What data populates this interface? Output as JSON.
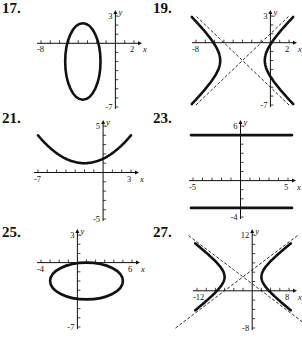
{
  "chart_data": [
    {
      "id": "17",
      "label": "17.",
      "type": "line",
      "shape": "ellipse",
      "center": [
        -3.5,
        -2
      ],
      "rx": 1.9,
      "ry": 4.2,
      "xlim": [
        -8,
        2
      ],
      "ylim": [
        -7,
        3
      ],
      "x_tick_labels": [
        "-8",
        "2"
      ],
      "y_tick_labels": [
        "3",
        "-7"
      ],
      "xlabel": "x",
      "ylabel": "y",
      "asymptotes": []
    },
    {
      "id": "19",
      "label": "19.",
      "type": "line",
      "shape": "hyperbola-horizontal",
      "center": [
        -3,
        -2
      ],
      "a": 2.4,
      "b": 2.4,
      "xlim": [
        -8,
        2
      ],
      "ylim": [
        -7,
        3
      ],
      "x_tick_labels": [
        "-8",
        "2"
      ],
      "y_tick_labels": [
        "3",
        "-7"
      ],
      "xlabel": "x",
      "ylabel": "y",
      "asymptotes": [
        "dashed"
      ]
    },
    {
      "id": "21",
      "label": "21.",
      "type": "line",
      "shape": "parabola",
      "vertex": [
        -2,
        1
      ],
      "points": [
        [
          -7,
          4
        ],
        [
          -2,
          1
        ],
        [
          3,
          4
        ]
      ],
      "xlim": [
        -7,
        3
      ],
      "ylim": [
        -5,
        5
      ],
      "x_tick_labels": [
        "-7",
        "3"
      ],
      "y_tick_labels": [
        "5",
        "-5"
      ],
      "xlabel": "x",
      "ylabel": "y",
      "asymptotes": []
    },
    {
      "id": "23",
      "label": "23.",
      "type": "line",
      "shape": "horizontal-lines",
      "lines_y": [
        5,
        -3
      ],
      "xlim": [
        -5,
        5
      ],
      "ylim": [
        -4,
        6
      ],
      "x_tick_labels": [
        "-5",
        "5"
      ],
      "y_tick_labels": [
        "6",
        "-4"
      ],
      "xlabel": "x",
      "ylabel": "y",
      "asymptotes": []
    },
    {
      "id": "25",
      "label": "25.",
      "type": "line",
      "shape": "ellipse",
      "center": [
        1,
        -2
      ],
      "rx": 4,
      "ry": 2,
      "xlim": [
        -4,
        6
      ],
      "ylim": [
        -7,
        3
      ],
      "x_tick_labels": [
        "-4",
        "6"
      ],
      "y_tick_labels": [
        "3",
        "-7"
      ],
      "xlabel": "x",
      "ylabel": "y",
      "asymptotes": []
    },
    {
      "id": "27",
      "label": "27.",
      "type": "line",
      "shape": "hyperbola-horizontal",
      "center": [
        -2,
        3
      ],
      "a": 4,
      "b": 3,
      "xlim": [
        -12,
        8
      ],
      "ylim": [
        -8,
        12
      ],
      "x_tick_labels": [
        "-12",
        "8"
      ],
      "y_tick_labels": [
        "12",
        "-8"
      ],
      "xlabel": "x",
      "ylabel": "y",
      "asymptotes": [
        "dashed"
      ]
    }
  ]
}
